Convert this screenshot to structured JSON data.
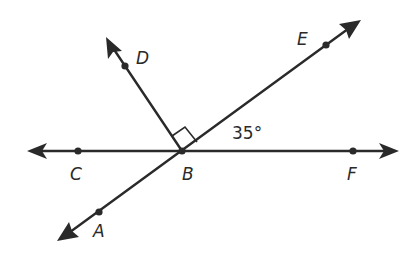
{
  "figure": {
    "colors": {
      "ink": "#2a2a2a",
      "background": "#ffffff"
    },
    "points": {
      "A": {
        "label": "A",
        "x": 99,
        "y": 212
      },
      "B": {
        "label": "B",
        "x": 182,
        "y": 151
      },
      "C": {
        "label": "C",
        "x": 78,
        "y": 151
      },
      "D": {
        "label": "D",
        "x": 125,
        "y": 66
      },
      "E": {
        "label": "E",
        "x": 326,
        "y": 45
      },
      "F": {
        "label": "F",
        "x": 353,
        "y": 151
      }
    },
    "lines": [
      {
        "name": "line-CF",
        "through": [
          "C",
          "B",
          "F"
        ],
        "arrows": "both"
      },
      {
        "name": "line-AE",
        "through": [
          "A",
          "B",
          "E"
        ],
        "arrows": "both"
      },
      {
        "name": "ray-BD",
        "through": [
          "B",
          "D"
        ],
        "arrows": "end"
      }
    ],
    "right_angle_marker": {
      "between": [
        "BD",
        "BE"
      ],
      "vertex": "B"
    },
    "angle_label": {
      "text": "35°",
      "angle": "EBF"
    }
  }
}
